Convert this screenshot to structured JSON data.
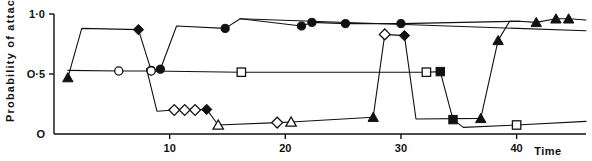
{
  "chart_data": {
    "type": "line",
    "title": "",
    "xlabel": "Time",
    "ylabel": "Probability of attack",
    "xlim": [
      0,
      46
    ],
    "ylim": [
      0,
      1.0
    ],
    "grid": false,
    "legend": false,
    "x_ticks": [
      10,
      20,
      30,
      40
    ],
    "x_tick_labels": [
      "10",
      "20",
      "30",
      "40"
    ],
    "y_ticks": [
      0,
      0.5,
      1.0
    ],
    "y_tick_labels": [
      "O",
      "O·5",
      "1·0"
    ],
    "series": [
      {
        "name": "upper-trace",
        "marker": "mixed",
        "points": [
          {
            "x": 1.2,
            "y": 0.47,
            "marker": "filled-triangle"
          },
          {
            "x": 2.4,
            "y": 0.88,
            "marker": "none"
          },
          {
            "x": 7.3,
            "y": 0.87,
            "marker": "filled-diamond"
          },
          {
            "x": 8.4,
            "y": 0.53,
            "marker": "open-circle"
          },
          {
            "x": 9.2,
            "y": 0.54,
            "marker": "filled-circle"
          },
          {
            "x": 10.6,
            "y": 0.9,
            "marker": "none"
          },
          {
            "x": 14.8,
            "y": 0.88,
            "marker": "filled-circle"
          },
          {
            "x": 16.1,
            "y": 0.96,
            "marker": "none"
          },
          {
            "x": 21.4,
            "y": 0.9,
            "marker": "filled-circle"
          },
          {
            "x": 22.3,
            "y": 0.93,
            "marker": "filled-circle"
          },
          {
            "x": 25.2,
            "y": 0.92,
            "marker": "filled-circle"
          },
          {
            "x": 30.0,
            "y": 0.92,
            "marker": "filled-circle"
          },
          {
            "x": 40.2,
            "y": 0.94,
            "marker": "none"
          },
          {
            "x": 41.7,
            "y": 0.93,
            "marker": "filled-triangle"
          },
          {
            "x": 43.4,
            "y": 0.96,
            "marker": "filled-triangle"
          },
          {
            "x": 44.5,
            "y": 0.96,
            "marker": "filled-triangle"
          },
          {
            "x": 46.0,
            "y": 0.95,
            "marker": "none"
          }
        ]
      },
      {
        "name": "descending-upper-tail",
        "marker": "none",
        "points": [
          {
            "x": 16.1,
            "y": 0.96,
            "marker": "none"
          },
          {
            "x": 46.0,
            "y": 0.86,
            "marker": "none"
          }
        ]
      },
      {
        "name": "mid-flat-trace",
        "marker": "mixed",
        "points": [
          {
            "x": 1.2,
            "y": 0.53,
            "marker": "none"
          },
          {
            "x": 5.6,
            "y": 0.525,
            "marker": "open-circle"
          },
          {
            "x": 8.4,
            "y": 0.525,
            "marker": "open-circle"
          },
          {
            "x": 16.2,
            "y": 0.515,
            "marker": "open-square"
          },
          {
            "x": 32.2,
            "y": 0.515,
            "marker": "open-square"
          },
          {
            "x": 33.4,
            "y": 0.52,
            "marker": "filled-square"
          },
          {
            "x": 34.5,
            "y": 0.12,
            "marker": "filled-square"
          },
          {
            "x": 35.4,
            "y": 0.055,
            "marker": "none"
          }
        ]
      },
      {
        "name": "lower-trace",
        "marker": "mixed",
        "points": [
          {
            "x": 8.0,
            "y": 0.545,
            "marker": "none"
          },
          {
            "x": 8.9,
            "y": 0.19,
            "marker": "none"
          },
          {
            "x": 10.4,
            "y": 0.2,
            "marker": "open-diamond"
          },
          {
            "x": 11.3,
            "y": 0.2,
            "marker": "open-diamond"
          },
          {
            "x": 12.2,
            "y": 0.2,
            "marker": "open-diamond"
          },
          {
            "x": 13.2,
            "y": 0.205,
            "marker": "filled-diamond"
          },
          {
            "x": 14.2,
            "y": 0.075,
            "marker": "open-triangle"
          },
          {
            "x": 19.3,
            "y": 0.095,
            "marker": "open-diamond"
          },
          {
            "x": 20.5,
            "y": 0.1,
            "marker": "open-triangle"
          },
          {
            "x": 27.6,
            "y": 0.14,
            "marker": "filled-triangle"
          },
          {
            "x": 28.6,
            "y": 0.83,
            "marker": "open-diamond"
          },
          {
            "x": 30.3,
            "y": 0.82,
            "marker": "filled-diamond"
          },
          {
            "x": 31.3,
            "y": 0.125,
            "marker": "none"
          },
          {
            "x": 36.9,
            "y": 0.13,
            "marker": "filled-triangle"
          },
          {
            "x": 38.4,
            "y": 0.78,
            "marker": "filled-triangle"
          },
          {
            "x": 39.4,
            "y": 0.94,
            "marker": "none"
          },
          {
            "x": 40.3,
            "y": 0.94,
            "marker": "none"
          }
        ]
      },
      {
        "name": "bottom-trace",
        "marker": "mixed",
        "points": [
          {
            "x": 35.4,
            "y": 0.055,
            "marker": "none"
          },
          {
            "x": 40.0,
            "y": 0.075,
            "marker": "open-square"
          },
          {
            "x": 46.0,
            "y": 0.105,
            "marker": "none"
          }
        ]
      }
    ]
  }
}
